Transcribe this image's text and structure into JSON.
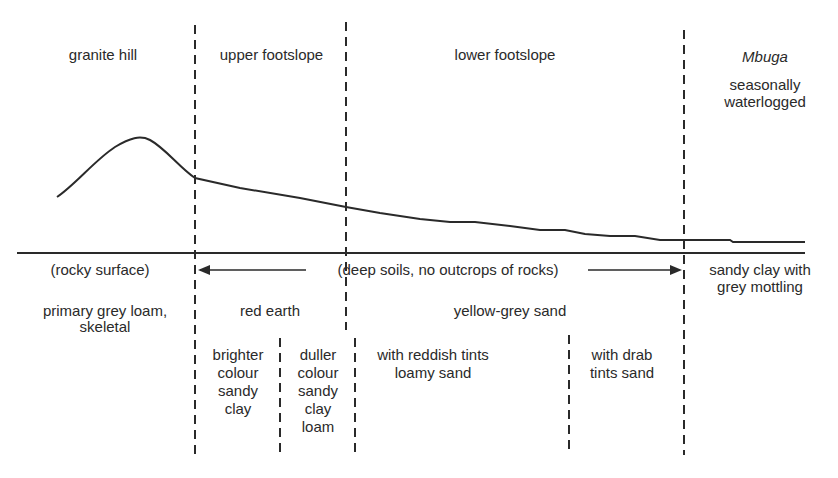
{
  "zones": {
    "granite_hill": "granite hill",
    "upper_footslope": "upper footslope",
    "lower_footslope": "lower footslope",
    "mbuga": "Mbuga",
    "mbuga_desc_1": "seasonally",
    "mbuga_desc_2": "waterlogged"
  },
  "surface": {
    "rocky": "(rocky surface)",
    "deep_soils": "(deep soils, no outcrops of rocks)",
    "mbuga_soil_1": "sandy clay with",
    "mbuga_soil_2": "grey mottling"
  },
  "soils": {
    "primary_1": "primary grey loam,",
    "primary_2": "skeletal",
    "red_earth": "red earth",
    "yellow_grey": "yellow-grey sand"
  },
  "subsoils": {
    "brighter": [
      "brighter",
      "colour",
      "sandy",
      "clay"
    ],
    "duller": [
      "duller",
      "colour",
      "sandy",
      "clay",
      "loam"
    ],
    "reddish": [
      "with reddish tints",
      "loamy sand"
    ],
    "drab": [
      "with drab",
      "tints sand"
    ]
  },
  "colors": {
    "ink": "#2a2a2a",
    "background": "#ffffff"
  }
}
